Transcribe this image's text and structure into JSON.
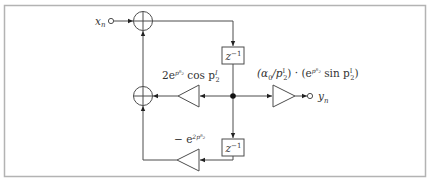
{
  "diagram": {
    "type": "signal-flow block diagram",
    "colors": {
      "frame": "#b3b3b3",
      "line": "#4d4d4d",
      "text": "#333333",
      "background": "#ffffff"
    },
    "input": {
      "label": "x",
      "subscript": "n"
    },
    "output": {
      "label": "y",
      "subscript": "n"
    },
    "delays": [
      {
        "id": "delay-top",
        "label": "z",
        "exponent": "−1"
      },
      {
        "id": "delay-bottom",
        "label": "z",
        "exponent": "−1"
      }
    ],
    "gains": {
      "feedback_1": {
        "prefix": "2e",
        "exp": "pᴿ₂",
        "tail": " cos p",
        "tail_sup": "I",
        "tail_sub": "2"
      },
      "feedback_2": {
        "prefix": "− e",
        "exp": "2pᴿ₂"
      },
      "output": {
        "part1": "(α",
        "part1_sub": "0",
        "part2": "/p",
        "part2_sup": "I",
        "part2_sub": "2",
        "part3": ") · (e",
        "part3_exp": "pᴿ₂",
        "part4": " sin p",
        "part4_sup": "I",
        "part4_sub": "2",
        "part5": ")"
      }
    },
    "adders": [
      "adder-top",
      "adder-bottom"
    ]
  }
}
